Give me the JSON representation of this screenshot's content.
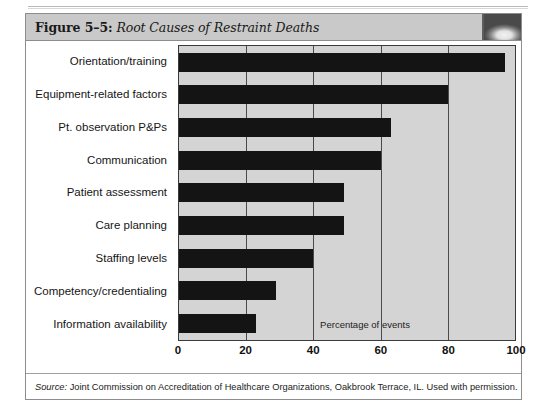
{
  "figure": {
    "number_label": "Figure 5–5:",
    "title": "Root Causes of Restraint Deaths",
    "thumbnail_icon": "decorative-photo-icon",
    "source": {
      "lead": "Source:",
      "text": " Joint Commission on Accreditation of Healthcare Organizations, Oakbrook Terrace, IL. Used with permission."
    }
  },
  "colors": {
    "header_bg": "#c9c9c9",
    "plot_bg": "#d4d4d4",
    "bar": "#141414",
    "gridline": "#4a4a4a",
    "frame": "#8d8d8d"
  },
  "chart_data": {
    "type": "bar",
    "orientation": "horizontal",
    "title": "Root Causes of Restraint Deaths",
    "xlabel": "Percentage of events",
    "ylabel": "",
    "xlim": [
      0,
      100
    ],
    "xticks": [
      0,
      20,
      40,
      60,
      80,
      100
    ],
    "xtick_labels": [
      "0",
      "20",
      "40",
      "60",
      "80",
      "100"
    ],
    "grid": true,
    "grid_axis": "x",
    "legend": false,
    "categories": [
      "Orientation/training",
      "Equipment-related factors",
      "Pt. observation P&Ps",
      "Communication",
      "Patient assessment",
      "Care planning",
      "Staffing levels",
      "Competency/credentialing",
      "Information availability"
    ],
    "values": [
      97,
      80,
      63,
      60,
      49,
      49,
      40,
      29,
      23
    ],
    "annotations": [
      {
        "text": "Percentage of events",
        "x": 42,
        "y_category": "Information availability"
      }
    ]
  }
}
